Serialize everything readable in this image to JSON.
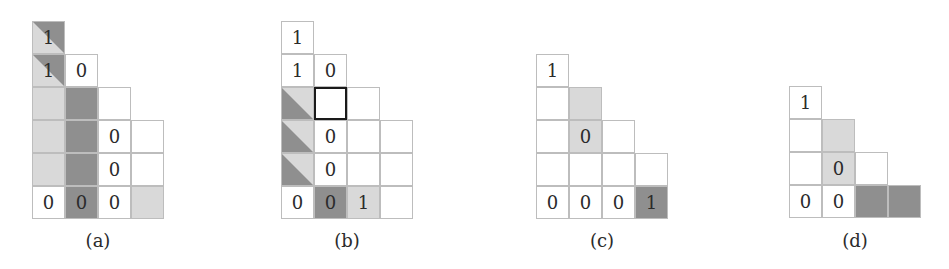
{
  "figure": {
    "colors": {
      "dark_gray": "#8f8f8f",
      "light_gray": "#d9d9d9",
      "grid_line": "#bdbdbd",
      "selected_border": "#1a1a1a"
    },
    "panels": [
      {
        "caption": "(a)",
        "rows": [
          [
            {
              "v": "1",
              "fill": "diag"
            }
          ],
          [
            {
              "v": "1",
              "fill": "diag"
            },
            {
              "v": "0",
              "fill": "white"
            }
          ],
          [
            {
              "v": "",
              "fill": "light"
            },
            {
              "v": "",
              "fill": "dark"
            },
            {
              "v": "",
              "fill": "white"
            }
          ],
          [
            {
              "v": "",
              "fill": "light"
            },
            {
              "v": "",
              "fill": "dark"
            },
            {
              "v": "0",
              "fill": "white"
            },
            {
              "v": "",
              "fill": "white"
            }
          ],
          [
            {
              "v": "",
              "fill": "light"
            },
            {
              "v": "",
              "fill": "dark"
            },
            {
              "v": "0",
              "fill": "white"
            },
            {
              "v": "",
              "fill": "white"
            }
          ],
          [
            {
              "v": "0",
              "fill": "white"
            },
            {
              "v": "0",
              "fill": "dark"
            },
            {
              "v": "0",
              "fill": "white"
            },
            {
              "v": "",
              "fill": "light"
            }
          ]
        ]
      },
      {
        "caption": "(b)",
        "rows": [
          [
            {
              "v": "1",
              "fill": "white"
            }
          ],
          [
            {
              "v": "1",
              "fill": "white"
            },
            {
              "v": "0",
              "fill": "white"
            }
          ],
          [
            {
              "v": "",
              "fill": "diag"
            },
            {
              "v": "",
              "fill": "white",
              "selected": true
            },
            {
              "v": "",
              "fill": "white"
            }
          ],
          [
            {
              "v": "",
              "fill": "diag"
            },
            {
              "v": "0",
              "fill": "white"
            },
            {
              "v": "",
              "fill": "white"
            },
            {
              "v": "",
              "fill": "white"
            }
          ],
          [
            {
              "v": "",
              "fill": "diag"
            },
            {
              "v": "0",
              "fill": "white"
            },
            {
              "v": "",
              "fill": "white"
            },
            {
              "v": "",
              "fill": "white"
            }
          ],
          [
            {
              "v": "0",
              "fill": "white"
            },
            {
              "v": "0",
              "fill": "dark"
            },
            {
              "v": "1",
              "fill": "light"
            },
            {
              "v": "",
              "fill": "white"
            }
          ]
        ]
      },
      {
        "caption": "(c)",
        "rows": [
          [
            {
              "v": "1",
              "fill": "white"
            }
          ],
          [
            {
              "v": "",
              "fill": "white"
            },
            {
              "v": "",
              "fill": "light"
            }
          ],
          [
            {
              "v": "",
              "fill": "white"
            },
            {
              "v": "0",
              "fill": "light"
            },
            {
              "v": "",
              "fill": "white"
            }
          ],
          [
            {
              "v": "",
              "fill": "white"
            },
            {
              "v": "",
              "fill": "white"
            },
            {
              "v": "",
              "fill": "white"
            },
            {
              "v": "",
              "fill": "white"
            }
          ],
          [
            {
              "v": "0",
              "fill": "white"
            },
            {
              "v": "0",
              "fill": "white"
            },
            {
              "v": "0",
              "fill": "white"
            },
            {
              "v": "1",
              "fill": "dark"
            }
          ]
        ]
      },
      {
        "caption": "(d)",
        "rows": [
          [
            {
              "v": "1",
              "fill": "white"
            }
          ],
          [
            {
              "v": "",
              "fill": "white"
            },
            {
              "v": "",
              "fill": "light"
            }
          ],
          [
            {
              "v": "",
              "fill": "white"
            },
            {
              "v": "0",
              "fill": "light"
            },
            {
              "v": "",
              "fill": "white"
            }
          ],
          [
            {
              "v": "0",
              "fill": "white"
            },
            {
              "v": "0",
              "fill": "white"
            },
            {
              "v": "",
              "fill": "dark"
            },
            {
              "v": "",
              "fill": "dark"
            }
          ]
        ]
      }
    ]
  }
}
